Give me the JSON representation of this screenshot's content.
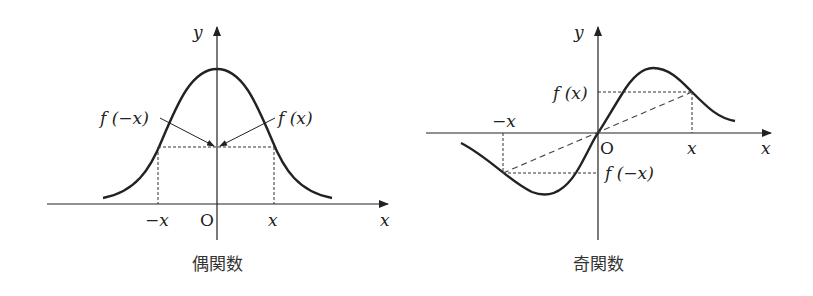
{
  "diagrams": [
    {
      "id": "even",
      "caption": "偶関数",
      "axis_labels": {
        "x": "x",
        "y": "y",
        "origin": "O"
      },
      "tick_labels": {
        "neg_x": "−x",
        "pos_x": "x"
      },
      "annotations": {
        "f_neg_x": "f (−x)",
        "f_x": "f (x)"
      },
      "description": "Bell-shaped even function symmetric about y-axis; f(−x) = f(x)"
    },
    {
      "id": "odd",
      "caption": "奇関数",
      "axis_labels": {
        "x": "x",
        "y": "y",
        "origin": "O"
      },
      "tick_labels": {
        "neg_x": "−x",
        "pos_x": "x"
      },
      "annotations": {
        "f_x": "f (x)",
        "f_neg_x": "f (−x)"
      },
      "description": "S-shaped odd function symmetric about origin; f(−x) = −f(x)"
    }
  ],
  "colors": {
    "stroke": "#222222",
    "background": "#ffffff"
  }
}
